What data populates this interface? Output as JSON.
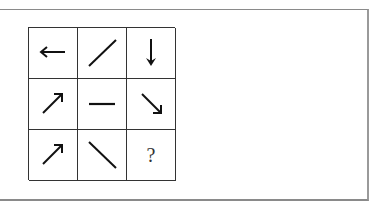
{
  "puzzle": {
    "rows": 3,
    "cols": 3,
    "cells": [
      {
        "symbol": "arrow-left",
        "label": "←"
      },
      {
        "symbol": "line-diagonal-up",
        "label": "/"
      },
      {
        "symbol": "arrow-down",
        "label": "↓"
      },
      {
        "symbol": "arrow-up-right",
        "label": "↗"
      },
      {
        "symbol": "line-horizontal",
        "label": "—"
      },
      {
        "symbol": "arrow-down-right",
        "label": "↘"
      },
      {
        "symbol": "arrow-up-right",
        "label": "↗"
      },
      {
        "symbol": "line-diagonal-down",
        "label": "\\"
      },
      {
        "symbol": "question-mark",
        "label": "?"
      }
    ],
    "missing_label": "?"
  }
}
